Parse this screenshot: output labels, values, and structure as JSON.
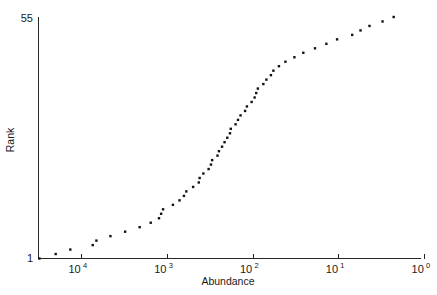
{
  "figure": {
    "background_color": "#ffffff",
    "ink_color": "#131313",
    "width": 437,
    "height": 295
  },
  "chart_data": {
    "type": "scatter",
    "title": "",
    "subtitle": "",
    "xlabel": "Abundance",
    "ylabel": "Rank",
    "x_scale": "log",
    "x_reversed": true,
    "xlim": [
      50000,
      1
    ],
    "ylim": [
      1,
      55
    ],
    "y_scale": "linear",
    "grid": false,
    "legend": null,
    "marker": "square",
    "marker_color": "#131313",
    "marker_size_px": 2.4,
    "x_tick_labels": [
      "10^4",
      "10^3",
      "10^2",
      "10^1",
      "10^0"
    ],
    "x_tick_mantissas": [
      "10",
      "10",
      "10",
      "10",
      "10"
    ],
    "x_tick_exponents": [
      "4",
      "3",
      "2",
      "1",
      "0"
    ],
    "x_tick_values": [
      10000,
      1000,
      100,
      10,
      1
    ],
    "y_tick_labels": [
      "1",
      "55"
    ],
    "y_tick_values": [
      1,
      55
    ],
    "n_points": 55,
    "series": [
      {
        "name": "species rank-abundance",
        "points": [
          {
            "rank": 1,
            "abundance": 31000
          },
          {
            "rank": 2,
            "abundance": 20000
          },
          {
            "rank": 3,
            "abundance": 13500
          },
          {
            "rank": 4,
            "abundance": 7400
          },
          {
            "rank": 5,
            "abundance": 6700
          },
          {
            "rank": 6,
            "abundance": 4600
          },
          {
            "rank": 7,
            "abundance": 3100
          },
          {
            "rank": 8,
            "abundance": 2100
          },
          {
            "rank": 9,
            "abundance": 1560
          },
          {
            "rank": 10,
            "abundance": 1250
          },
          {
            "rank": 11,
            "abundance": 1180
          },
          {
            "rank": 12,
            "abundance": 1120
          },
          {
            "rank": 13,
            "abundance": 860
          },
          {
            "rank": 14,
            "abundance": 720
          },
          {
            "rank": 15,
            "abundance": 640
          },
          {
            "rank": 16,
            "abundance": 600
          },
          {
            "rank": 17,
            "abundance": 500
          },
          {
            "rank": 18,
            "abundance": 430
          },
          {
            "rank": 19,
            "abundance": 420
          },
          {
            "rank": 20,
            "abundance": 380
          },
          {
            "rank": 21,
            "abundance": 330
          },
          {
            "rank": 22,
            "abundance": 310
          },
          {
            "rank": 23,
            "abundance": 300
          },
          {
            "rank": 24,
            "abundance": 260
          },
          {
            "rank": 25,
            "abundance": 250
          },
          {
            "rank": 26,
            "abundance": 230
          },
          {
            "rank": 27,
            "abundance": 215
          },
          {
            "rank": 28,
            "abundance": 200
          },
          {
            "rank": 29,
            "abundance": 186
          },
          {
            "rank": 30,
            "abundance": 182
          },
          {
            "rank": 31,
            "abundance": 160
          },
          {
            "rank": 32,
            "abundance": 150
          },
          {
            "rank": 33,
            "abundance": 140
          },
          {
            "rank": 34,
            "abundance": 124
          },
          {
            "rank": 35,
            "abundance": 118
          },
          {
            "rank": 36,
            "abundance": 104
          },
          {
            "rank": 37,
            "abundance": 96
          },
          {
            "rank": 38,
            "abundance": 92
          },
          {
            "rank": 39,
            "abundance": 88
          },
          {
            "rank": 40,
            "abundance": 76
          },
          {
            "rank": 41,
            "abundance": 70
          },
          {
            "rank": 42,
            "abundance": 62
          },
          {
            "rank": 43,
            "abundance": 58
          },
          {
            "rank": 44,
            "abundance": 50
          },
          {
            "rank": 45,
            "abundance": 42
          },
          {
            "rank": 46,
            "abundance": 33
          },
          {
            "rank": 47,
            "abundance": 26
          },
          {
            "rank": 48,
            "abundance": 19
          },
          {
            "rank": 49,
            "abundance": 14
          },
          {
            "rank": 50,
            "abundance": 10.5
          },
          {
            "rank": 51,
            "abundance": 7.0
          },
          {
            "rank": 52,
            "abundance": 5.6
          },
          {
            "rank": 53,
            "abundance": 4.4
          },
          {
            "rank": 54,
            "abundance": 3.1
          },
          {
            "rank": 55,
            "abundance": 2.3
          }
        ]
      }
    ]
  }
}
